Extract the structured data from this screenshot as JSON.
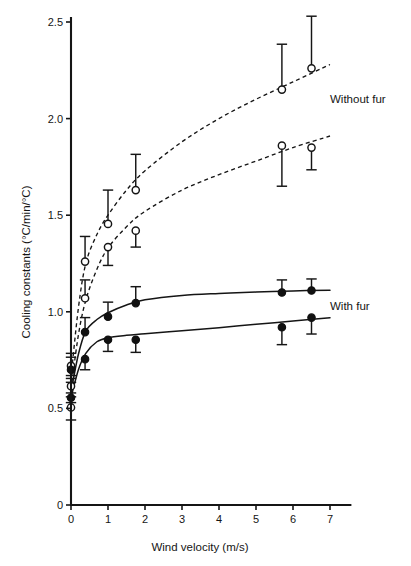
{
  "chart_data": {
    "type": "scatter",
    "title": "",
    "xlabel": "Wind velocity (m/s)",
    "ylabel": "Cooling constants (°C/min/°C)",
    "xlim": [
      0,
      7.55
    ],
    "ylim": [
      0,
      2.5
    ],
    "xticks": [
      "0",
      "1",
      "2",
      "3",
      "4",
      "5",
      "6",
      "7"
    ],
    "xtick_values": [
      0,
      1,
      2,
      3,
      4,
      5,
      6,
      7
    ],
    "yticks": [
      "0",
      "0.5",
      "1.0",
      "1.5",
      "2.0",
      "2.5"
    ],
    "ytick_values": [
      0,
      0.5,
      1.0,
      1.5,
      2.0,
      2.5
    ],
    "grid": false,
    "legend_position": "inline-annotation-right",
    "annotations": [
      {
        "text": "Without fur",
        "x": 7.0,
        "y": 2.08
      },
      {
        "text": "With fur",
        "x": 7.0,
        "y": 1.01
      }
    ],
    "series": [
      {
        "name": "Without fur - series A",
        "marker": "open-circle",
        "line": "dashed",
        "points": [
          {
            "x": 0.0,
            "y": 0.72,
            "err_low": 0.065,
            "err_high": 0.065
          },
          {
            "x": 0.38,
            "y": 1.26,
            "err_low": 0.0,
            "err_high": 0.13
          },
          {
            "x": 1.0,
            "y": 1.455,
            "err_low": 0.0,
            "err_high": 0.175
          },
          {
            "x": 1.75,
            "y": 1.63,
            "err_low": 0.0,
            "err_high": 0.185
          },
          {
            "x": 5.7,
            "y": 2.15,
            "err_low": 0.0,
            "err_high": 0.235
          },
          {
            "x": 6.5,
            "y": 2.26,
            "err_low": 0.0,
            "err_high": 0.27
          }
        ],
        "fit_curve": [
          {
            "x": 0.0,
            "y": 0.66
          },
          {
            "x": 0.2,
            "y": 1.02
          },
          {
            "x": 0.4,
            "y": 1.25
          },
          {
            "x": 0.7,
            "y": 1.4
          },
          {
            "x": 1.0,
            "y": 1.5
          },
          {
            "x": 1.5,
            "y": 1.63
          },
          {
            "x": 2.0,
            "y": 1.73
          },
          {
            "x": 3.0,
            "y": 1.88
          },
          {
            "x": 4.0,
            "y": 2.0
          },
          {
            "x": 5.0,
            "y": 2.1
          },
          {
            "x": 6.0,
            "y": 2.19
          },
          {
            "x": 7.0,
            "y": 2.28
          }
        ]
      },
      {
        "name": "Without fur - series B",
        "marker": "open-circle",
        "line": "dashed",
        "points": [
          {
            "x": 0.0,
            "y": 0.615,
            "err_low": 0.055,
            "err_high": 0.055
          },
          {
            "x": 0.0,
            "y": 0.505,
            "err_low": 0.065,
            "err_high": 0.0
          },
          {
            "x": 0.38,
            "y": 1.07,
            "err_low": 0.0,
            "err_high": 0.095
          },
          {
            "x": 1.0,
            "y": 1.335,
            "err_low": 0.095,
            "err_high": 0.0
          },
          {
            "x": 1.75,
            "y": 1.42,
            "err_low": 0.085,
            "err_high": 0.0
          },
          {
            "x": 5.7,
            "y": 1.86,
            "err_low": 0.21,
            "err_high": 0.0
          },
          {
            "x": 6.5,
            "y": 1.85,
            "err_low": 0.115,
            "err_high": 0.0
          }
        ],
        "fit_curve": [
          {
            "x": 0.0,
            "y": 0.6
          },
          {
            "x": 0.2,
            "y": 0.88
          },
          {
            "x": 0.4,
            "y": 1.06
          },
          {
            "x": 0.7,
            "y": 1.22
          },
          {
            "x": 1.0,
            "y": 1.33
          },
          {
            "x": 1.5,
            "y": 1.44
          },
          {
            "x": 2.0,
            "y": 1.52
          },
          {
            "x": 3.0,
            "y": 1.63
          },
          {
            "x": 4.0,
            "y": 1.71
          },
          {
            "x": 5.0,
            "y": 1.78
          },
          {
            "x": 6.0,
            "y": 1.85
          },
          {
            "x": 7.0,
            "y": 1.91
          }
        ]
      },
      {
        "name": "With fur - series A",
        "marker": "filled-circle",
        "line": "solid",
        "points": [
          {
            "x": 0.0,
            "y": 0.555,
            "err_low": 0.025,
            "err_high": 0.025
          },
          {
            "x": 0.38,
            "y": 0.755,
            "err_low": 0.055,
            "err_high": 0.0
          },
          {
            "x": 1.0,
            "y": 0.855,
            "err_low": 0.06,
            "err_high": 0.0
          },
          {
            "x": 1.75,
            "y": 0.855,
            "err_low": 0.065,
            "err_high": 0.0
          },
          {
            "x": 5.7,
            "y": 0.92,
            "err_low": 0.09,
            "err_high": 0.0
          },
          {
            "x": 6.5,
            "y": 0.97,
            "err_low": 0.085,
            "err_high": 0.0
          }
        ],
        "fit_curve": [
          {
            "x": 0.0,
            "y": 0.555
          },
          {
            "x": 0.2,
            "y": 0.7
          },
          {
            "x": 0.4,
            "y": 0.785
          },
          {
            "x": 0.7,
            "y": 0.845
          },
          {
            "x": 1.0,
            "y": 0.866
          },
          {
            "x": 1.5,
            "y": 0.878
          },
          {
            "x": 2.0,
            "y": 0.886
          },
          {
            "x": 3.0,
            "y": 0.902
          },
          {
            "x": 4.0,
            "y": 0.918
          },
          {
            "x": 5.0,
            "y": 0.935
          },
          {
            "x": 6.0,
            "y": 0.952
          },
          {
            "x": 7.0,
            "y": 0.969
          }
        ]
      },
      {
        "name": "With fur - series B",
        "marker": "filled-circle",
        "line": "solid",
        "points": [
          {
            "x": 0.0,
            "y": 0.7,
            "err_low": 0.065,
            "err_high": 0.065
          },
          {
            "x": 0.38,
            "y": 0.895,
            "err_low": 0.0,
            "err_high": 0.075
          },
          {
            "x": 1.0,
            "y": 0.975,
            "err_low": 0.0,
            "err_high": 0.075
          },
          {
            "x": 1.75,
            "y": 1.045,
            "err_low": 0.0,
            "err_high": 0.085
          },
          {
            "x": 5.7,
            "y": 1.1,
            "err_low": 0.0,
            "err_high": 0.065
          },
          {
            "x": 6.5,
            "y": 1.11,
            "err_low": 0.0,
            "err_high": 0.06
          }
        ],
        "fit_curve": [
          {
            "x": 0.0,
            "y": 0.585
          },
          {
            "x": 0.2,
            "y": 0.78
          },
          {
            "x": 0.4,
            "y": 0.9
          },
          {
            "x": 0.7,
            "y": 0.96
          },
          {
            "x": 1.0,
            "y": 0.995
          },
          {
            "x": 1.5,
            "y": 1.035
          },
          {
            "x": 2.0,
            "y": 1.062
          },
          {
            "x": 3.0,
            "y": 1.085
          },
          {
            "x": 4.0,
            "y": 1.095
          },
          {
            "x": 5.0,
            "y": 1.102
          },
          {
            "x": 6.0,
            "y": 1.108
          },
          {
            "x": 7.0,
            "y": 1.112
          }
        ]
      }
    ]
  }
}
